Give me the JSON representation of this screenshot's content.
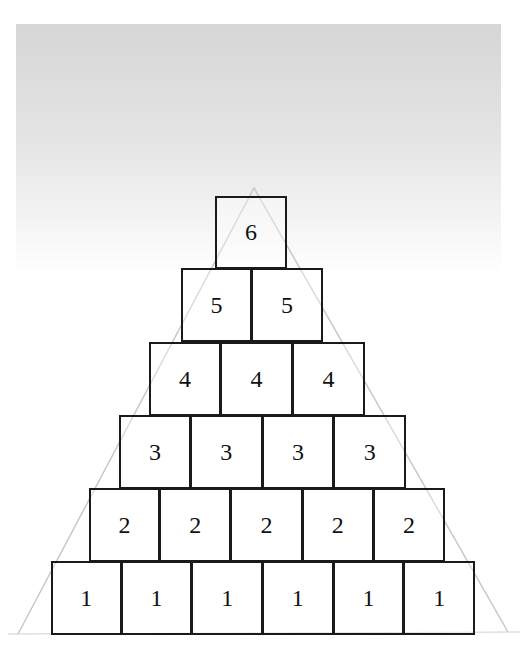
{
  "diagram": {
    "type": "number-pyramid",
    "rows": [
      {
        "level": 6,
        "blocks": [
          "6"
        ]
      },
      {
        "level": 5,
        "blocks": [
          "5",
          "5"
        ]
      },
      {
        "level": 4,
        "blocks": [
          "4",
          "4",
          "4"
        ]
      },
      {
        "level": 3,
        "blocks": [
          "3",
          "3",
          "3",
          "3"
        ]
      },
      {
        "level": 2,
        "blocks": [
          "2",
          "2",
          "2",
          "2",
          "2"
        ]
      },
      {
        "level": 1,
        "blocks": [
          "1",
          "1",
          "1",
          "1",
          "1",
          "1"
        ]
      }
    ]
  }
}
